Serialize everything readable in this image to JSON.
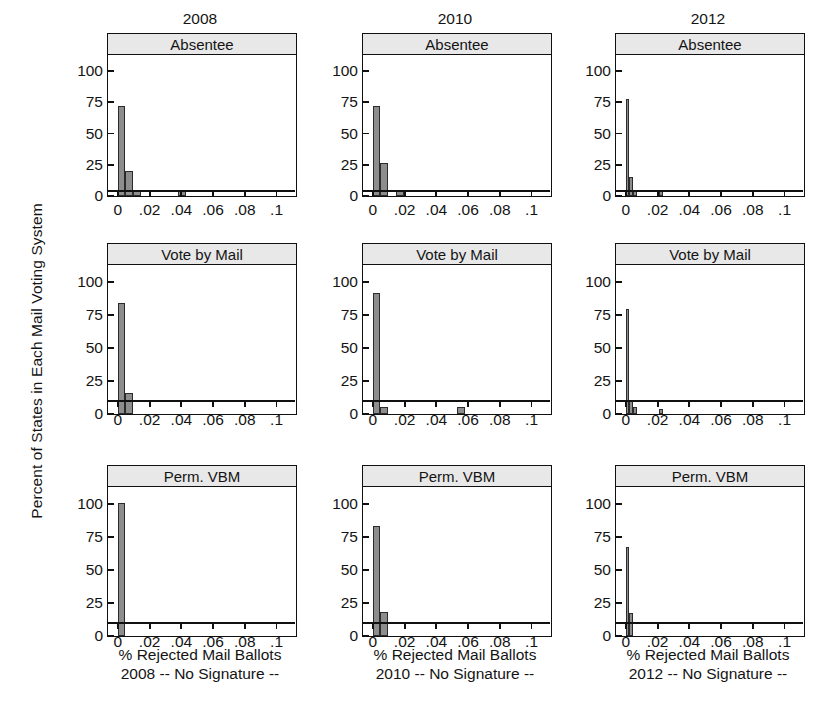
{
  "figure": {
    "ylabel": "Percent of States in Each Mail Voting System",
    "column_titles": [
      "2008",
      "2010",
      "2012"
    ],
    "row_titles": [
      "Absentee",
      "Vote by Mail",
      "Perm. VBM"
    ],
    "captions": [
      {
        "line1": "% Rejected Mail Ballots",
        "line2": "2008 -- No Signature --"
      },
      {
        "line1": "% Rejected Mail Ballots",
        "line2": "2010 -- No Signature --"
      },
      {
        "line1": "% Rejected Mail Ballots",
        "line2": "2012 -- No Signature --"
      }
    ],
    "ytick_labels": [
      "0",
      "25",
      "50",
      "75",
      "100"
    ],
    "xtick_labels": [
      "0",
      ".02",
      ".04",
      ".06",
      ".08",
      ".1"
    ],
    "bar_color": "#8d8d8d",
    "strip_color": "#e8e8e8",
    "axis_color": "#101010"
  },
  "chart_data": {
    "type": "bar",
    "title": "",
    "xlabel": "% Rejected Mail Ballots -- No Signature --",
    "ylabel": "Percent of States in Each Mail Voting System",
    "ylim": [
      0,
      112
    ],
    "xlim": [
      -0.006,
      0.112
    ],
    "grid": false,
    "legend": "none",
    "layout": "3x3 trellis: columns = election year, rows = mail voting system",
    "yticks": [
      0,
      25,
      50,
      75,
      100
    ],
    "xticks": [
      0,
      0.02,
      0.04,
      0.06,
      0.08,
      0.1
    ],
    "bin_width": 0.005,
    "panels": [
      {
        "column": "2008",
        "row": "Absentee",
        "bins": [
          {
            "x0": 0.0,
            "x1": 0.005,
            "value": 72
          },
          {
            "x0": 0.005,
            "x1": 0.01,
            "value": 20
          },
          {
            "x0": 0.01,
            "x1": 0.015,
            "value": 5
          },
          {
            "x0": 0.038,
            "x1": 0.043,
            "value": 5
          }
        ]
      },
      {
        "column": "2008",
        "row": "Vote by Mail",
        "bins": [
          {
            "x0": 0.0,
            "x1": 0.005,
            "value": 84
          },
          {
            "x0": 0.005,
            "x1": 0.01,
            "value": 16
          }
        ]
      },
      {
        "column": "2008",
        "row": "Perm. VBM",
        "bins": [
          {
            "x0": 0.0,
            "x1": 0.005,
            "value": 100
          }
        ]
      },
      {
        "column": "2010",
        "row": "Absentee",
        "bins": [
          {
            "x0": 0.0,
            "x1": 0.005,
            "value": 72
          },
          {
            "x0": 0.005,
            "x1": 0.01,
            "value": 26
          },
          {
            "x0": 0.015,
            "x1": 0.02,
            "value": 5
          }
        ]
      },
      {
        "column": "2010",
        "row": "Vote by Mail",
        "bins": [
          {
            "x0": 0.0,
            "x1": 0.005,
            "value": 91
          },
          {
            "x0": 0.005,
            "x1": 0.01,
            "value": 5
          },
          {
            "x0": 0.053,
            "x1": 0.058,
            "value": 5
          }
        ]
      },
      {
        "column": "2010",
        "row": "Perm. VBM",
        "bins": [
          {
            "x0": 0.0,
            "x1": 0.005,
            "value": 83
          },
          {
            "x0": 0.005,
            "x1": 0.01,
            "value": 18
          }
        ]
      },
      {
        "column": "2012",
        "row": "Absentee",
        "bins": [
          {
            "x0": 0.0,
            "x1": 0.0025,
            "value": 77
          },
          {
            "x0": 0.0025,
            "x1": 0.005,
            "value": 15
          },
          {
            "x0": 0.005,
            "x1": 0.0075,
            "value": 4
          },
          {
            "x0": 0.021,
            "x1": 0.0235,
            "value": 4
          }
        ]
      },
      {
        "column": "2012",
        "row": "Vote by Mail",
        "bins": [
          {
            "x0": 0.0,
            "x1": 0.0025,
            "value": 79
          },
          {
            "x0": 0.0025,
            "x1": 0.005,
            "value": 10
          },
          {
            "x0": 0.005,
            "x1": 0.0075,
            "value": 5
          },
          {
            "x0": 0.021,
            "x1": 0.0235,
            "value": 4
          }
        ]
      },
      {
        "column": "2012",
        "row": "Perm. VBM",
        "bins": [
          {
            "x0": 0.0,
            "x1": 0.0025,
            "value": 67
          },
          {
            "x0": 0.0025,
            "x1": 0.005,
            "value": 17
          }
        ]
      }
    ]
  }
}
